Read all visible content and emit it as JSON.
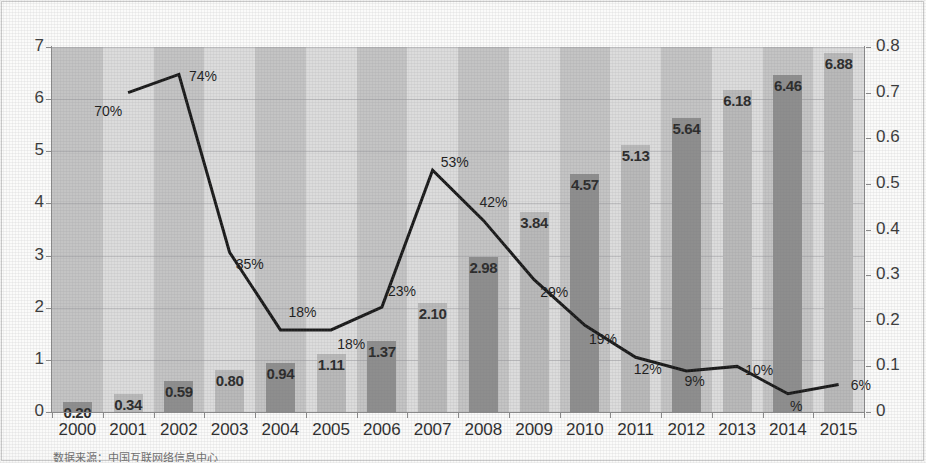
{
  "chart_data": {
    "type": "bar",
    "title": "",
    "subtitle": "",
    "xlabel": "",
    "ylabel": "",
    "grid": true,
    "legend_position": "none",
    "categories": [
      "2000",
      "2001",
      "2002",
      "2003",
      "2004",
      "2005",
      "2006",
      "2007",
      "2008",
      "2009",
      "2010",
      "2011",
      "2012",
      "2013",
      "2014",
      "2015"
    ],
    "axes": {
      "left": {
        "label": "",
        "min": 0,
        "max": 7,
        "step": 1,
        "ticks": [
          "0",
          "1",
          "2",
          "3",
          "4",
          "5",
          "6",
          "7"
        ]
      },
      "right": {
        "label": "",
        "min": 0,
        "max": 0.8,
        "step": 0.1,
        "ticks": [
          "0",
          "0.1",
          "0.2",
          "0.3",
          "0.4",
          "0.5",
          "0.6",
          "0.7",
          "0.8"
        ]
      }
    },
    "series": [
      {
        "name": "netizens",
        "type": "bar",
        "axis": "left",
        "values": [
          0.2,
          0.34,
          0.59,
          0.8,
          0.94,
          1.11,
          1.37,
          2.1,
          2.98,
          3.84,
          4.57,
          5.13,
          5.64,
          6.18,
          6.46,
          6.88
        ],
        "labels": [
          "0.20",
          "0.34",
          "0.59",
          "0.80",
          "0.94",
          "1.11",
          "1.37",
          "2.10",
          "2.98",
          "3.84",
          "4.57",
          "5.13",
          "5.64",
          "6.18",
          "6.46",
          "6.88"
        ]
      },
      {
        "name": "growth-rate",
        "type": "line",
        "axis": "right",
        "values": [
          null,
          0.7,
          0.74,
          0.35,
          0.18,
          0.18,
          0.23,
          0.53,
          0.42,
          0.29,
          0.19,
          0.12,
          0.09,
          0.1,
          0.04,
          0.06
        ],
        "labels": [
          "",
          "70%",
          "74%",
          "35%",
          "18%",
          "18%",
          "23%",
          "53%",
          "42%",
          "29%",
          "19%",
          "12%",
          "9%",
          "10%",
          "%",
          "6%"
        ]
      }
    ],
    "colors": {
      "bar_light": "#b9b9b9",
      "bar_dark": "#8e8e8e",
      "band_light": "#dcdcdc",
      "band_dark": "#c4c4c4",
      "line": "#1a1a1a",
      "axis": "#8a8a8a",
      "text": "#2b2b2b"
    }
  },
  "source_note": "数据来源：中国互联网络信息中心"
}
